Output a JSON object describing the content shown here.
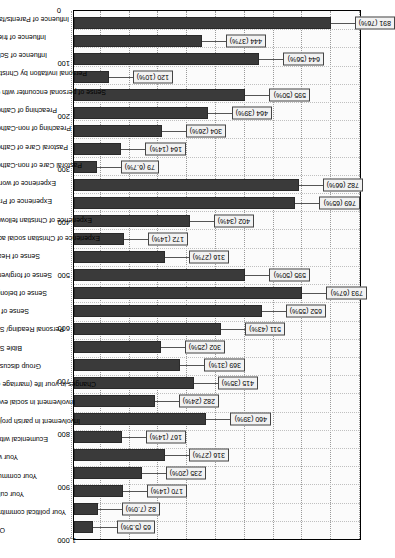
{
  "chart_data": {
    "type": "bar",
    "title": "",
    "subtitle": "",
    "xlabel": "",
    "ylabel": "",
    "ylim": [
      0,
      1000
    ],
    "grid": true,
    "legend": "none",
    "orientation": "vertical-bars-on-rotated-page",
    "tick_labels": [
      "0",
      "100",
      "200",
      "300",
      "400",
      "500",
      "600",
      "700",
      "800",
      "900",
      "1,000"
    ],
    "tick_values": [
      0,
      100,
      200,
      300,
      400,
      500,
      600,
      700,
      800,
      900,
      1000
    ],
    "categories": [
      "Influence of Parents/family",
      "Influence of friends",
      "Influence of School",
      "Personal invitation by Christians",
      "Sense of personal encounter with God",
      "Preaching of Catholics",
      "Preaching of non-Catholics",
      "Pastoral Care of Catholics",
      "Pastoral Care of non-Catholics",
      "Experience of worship",
      "Experience of Prayer",
      "Experience of Christian fellowship",
      "Experience of Christian social action",
      "Sense of Healing",
      "Sense of forgiveness",
      "Sense of belonging",
      "Sense of love",
      "Personal Reading/ Study",
      "Bible Study",
      "Group discussion",
      "Changes in your life (marriage etc.)",
      "Involvement in social events",
      "Involvement in parish projects",
      "Ecumenical witness",
      "Your work",
      "Your community",
      "Your culture",
      "Your political commitment",
      "Other"
    ],
    "values": [
      891,
      444,
      644,
      120,
      595,
      464,
      304,
      164,
      79,
      782,
      769,
      402,
      172,
      316,
      595,
      793,
      652,
      511,
      302,
      369,
      415,
      282,
      460,
      167,
      316,
      235,
      170,
      82,
      65
    ],
    "percents": [
      "76%",
      "37%",
      "56%",
      "10%",
      "50%",
      "39%",
      "26%",
      "14%",
      "6.7%",
      "66%",
      "65%",
      "34%",
      "14%",
      "27%",
      "50%",
      "67%",
      "55%",
      "43%",
      "25%",
      "31%",
      "35%",
      "24%",
      "39%",
      "14%",
      "27%",
      "20%",
      "14%",
      "7.0%",
      "5.5%"
    ],
    "labels": [
      "891 (76%)",
      "444 (37%)",
      "644 (56%)",
      "120 (10%)",
      "595 (50%)",
      "464 (39%)",
      "304 (26%)",
      "164 (14%)",
      "79 (6.7%)",
      "782 (66%)",
      "769 (65%)",
      "402 (34%)",
      "172 (14%)",
      "316 (27%)",
      "595 (50%)",
      "793 (67%)",
      "652 (55%)",
      "511 (43%)",
      "302 (25%)",
      "369 (31%)",
      "415 (35%)",
      "282 (24%)",
      "460 (39%)",
      "167 (14%)",
      "316 (27%)",
      "235 (20%)",
      "170 (14%)",
      "82 (7.0%)",
      "65 (5.5%)"
    ],
    "colors": {
      "bar_fill": "#3a3a3a",
      "bar_stroke": "#2a2a2a",
      "plot_bg": "#fbfbfb",
      "grid": "#9a9a9a",
      "callout_bg": "#f2f2f2",
      "callout_border": "#444444",
      "text": "#000000"
    }
  }
}
